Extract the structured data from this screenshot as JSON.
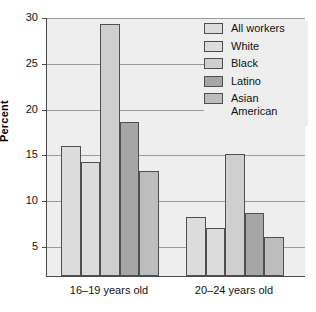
{
  "chart_data": {
    "type": "bar",
    "title": "",
    "subtitle": "",
    "xlabel": "",
    "ylabel": "Percent",
    "categories": [
      "16–19 years old",
      "20–24 years old"
    ],
    "series": [
      {
        "name": "All workers",
        "values": [
          15.9,
          8.2
        ],
        "color": "#dcdcdc"
      },
      {
        "name": "White",
        "values": [
          14.2,
          7.0
        ],
        "color": "#dcdcdc"
      },
      {
        "name": "Black",
        "values": [
          29.2,
          15.0
        ],
        "color": "#cfcfcf"
      },
      {
        "name": "Latino",
        "values": [
          18.5,
          8.6
        ],
        "color": "#a6a6a6"
      },
      {
        "name": "Asian\nAmerican",
        "values": [
          13.2,
          6.0
        ],
        "color": "#bdbdbd"
      }
    ],
    "ylim": [
      1.7,
      30
    ],
    "yticks": [
      5,
      10,
      15,
      20,
      25,
      30
    ],
    "ytick_labels": [
      "5",
      "10",
      "15",
      "20",
      "25",
      "30"
    ],
    "grid": true,
    "legend_position": "top-right",
    "plot_background": "#eeeeee",
    "axis_color": "#4a4a4a",
    "gridline_color": "#9a9a9a"
  }
}
